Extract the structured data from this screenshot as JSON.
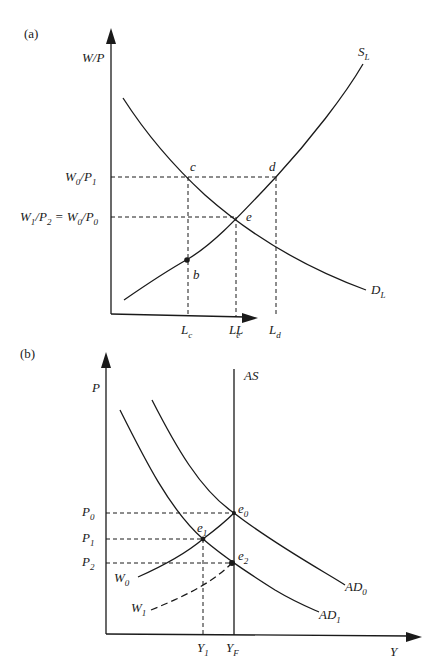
{
  "panel_a": {
    "tag": "(a)",
    "y_axis_label": "W/P",
    "x_axis_label": "L",
    "curves": {
      "supply": {
        "label": "S",
        "sub": "L"
      },
      "demand": {
        "label": "D",
        "sub": "L"
      }
    },
    "y_ticks": {
      "upper": {
        "text": "W",
        "sub1": "0",
        "slash": "/P",
        "sub2": "1"
      },
      "lower": {
        "text1": "W",
        "sub1": "1",
        "slash1": "/P",
        "sub2": "2",
        "eq": " = W",
        "sub3": "0",
        "slash2": "/P",
        "sub4": "0"
      }
    },
    "x_ticks": [
      {
        "text": "L",
        "sub": "c"
      },
      {
        "text": "L",
        "sub": "e"
      },
      {
        "text": "L",
        "sub": "d"
      }
    ],
    "points": {
      "c": "c",
      "d": "d",
      "e": "e",
      "b": "b"
    }
  },
  "panel_b": {
    "tag": "(b)",
    "y_axis_label": "P",
    "x_axis_label": "Y",
    "curves": {
      "as": {
        "label": "AS"
      },
      "ad0": {
        "label": "AD",
        "sub": "0"
      },
      "ad1": {
        "label": "AD",
        "sub": "1"
      },
      "w0": {
        "label": "W",
        "sub": "0"
      },
      "w1": {
        "label": "W",
        "sub": "1"
      }
    },
    "y_ticks": [
      {
        "text": "P",
        "sub": "0"
      },
      {
        "text": "P",
        "sub": "1"
      },
      {
        "text": "P",
        "sub": "2"
      }
    ],
    "x_ticks": [
      {
        "text": "Y",
        "sub": "1"
      },
      {
        "text": "Y",
        "sub": "F"
      }
    ],
    "points": [
      {
        "text": "e",
        "sub": "0"
      },
      {
        "text": "e",
        "sub": "1"
      },
      {
        "text": "e",
        "sub": "2"
      }
    ]
  }
}
